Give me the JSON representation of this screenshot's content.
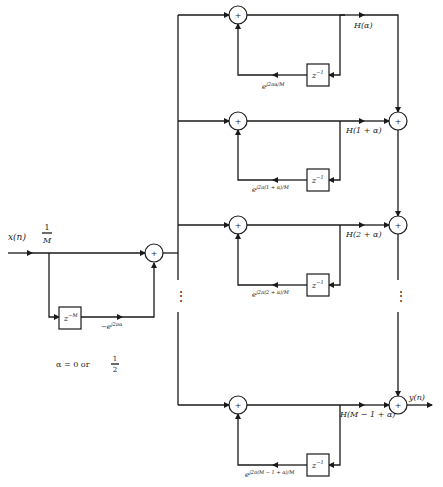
{
  "diagram": {
    "input": {
      "signal": "x(n)",
      "gain_num": "1",
      "gain_den": "M"
    },
    "comb": {
      "delay": "z",
      "delay_exp": "−M",
      "coef": "−e",
      "coef_exp": "j2πα"
    },
    "adder_symbol": "+",
    "branches": [
      {
        "output_label": "H(α)",
        "delay": "z",
        "delay_exp": "−1",
        "coef": "e",
        "coef_exp": "j2πα/M"
      },
      {
        "output_label": "H(1 + α)",
        "delay": "z",
        "delay_exp": "−1",
        "coef": "e",
        "coef_exp": "j2π(1 + α)/M"
      },
      {
        "output_label": "H(2 + α)",
        "delay": "z",
        "delay_exp": "−1",
        "coef": "e",
        "coef_exp": "j2π(2 + α)/M"
      },
      {
        "output_label": "H(M − 1 + α)",
        "delay": "z",
        "delay_exp": "−1",
        "coef": "e",
        "coef_exp": "j2π(M − 1 + α)/M"
      }
    ],
    "output": {
      "signal": "y(n)"
    },
    "ellipsis": "⋮",
    "note": {
      "text": "α = 0 or",
      "frac_num": "1",
      "frac_den": "2"
    }
  }
}
